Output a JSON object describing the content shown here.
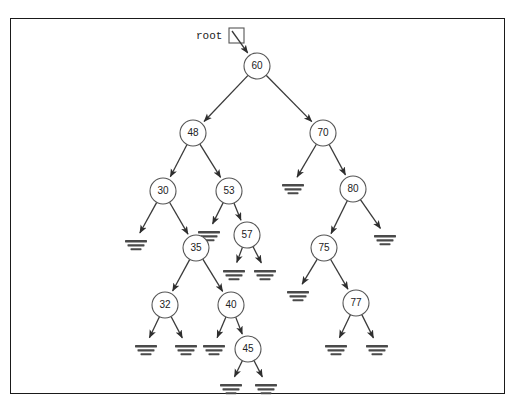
{
  "diagram": {
    "root_pointer_label": "root",
    "null_symbol_name": "ground-null-symbol",
    "colors": {
      "node_stroke": "#555555",
      "node_fill": "#ffffff",
      "edge": "#3a3a3a",
      "null_marker": "#4a4a4a",
      "frame_border": "#1a1a1a",
      "text": "#222222",
      "background": "#ffffff"
    },
    "frame": {
      "x": 10,
      "y": 18,
      "width": 495,
      "height": 376
    },
    "root_pointer": {
      "text_x": 196,
      "text_y": 36,
      "box_x": 229,
      "box_y": 28,
      "box_size": 15,
      "arrow_from_x": 232,
      "arrow_from_y": 31,
      "arrow_to_x": 254,
      "arrow_to_y": 50
    }
  },
  "chart_data": {
    "type": "diagram",
    "node_radius": 13,
    "nodes": [
      {
        "id": "n60",
        "label": "60",
        "x": 257,
        "y": 66
      },
      {
        "id": "n48",
        "label": "48",
        "x": 193,
        "y": 133
      },
      {
        "id": "n70",
        "label": "70",
        "x": 323,
        "y": 133
      },
      {
        "id": "n30",
        "label": "30",
        "x": 163,
        "y": 191
      },
      {
        "id": "n53",
        "label": "53",
        "x": 229,
        "y": 191
      },
      {
        "id": "n80",
        "label": "80",
        "x": 353,
        "y": 189
      },
      {
        "id": "n35",
        "label": "35",
        "x": 196,
        "y": 248
      },
      {
        "id": "n57",
        "label": "57",
        "x": 247,
        "y": 235
      },
      {
        "id": "n75",
        "label": "75",
        "x": 324,
        "y": 248
      },
      {
        "id": "n32",
        "label": "32",
        "x": 165,
        "y": 305
      },
      {
        "id": "n40",
        "label": "40",
        "x": 231,
        "y": 305
      },
      {
        "id": "n77",
        "label": "77",
        "x": 356,
        "y": 303
      },
      {
        "id": "n45",
        "label": "45",
        "x": 248,
        "y": 349
      }
    ],
    "nulls": [
      {
        "id": "x70L",
        "x": 293,
        "y": 184
      },
      {
        "id": "x30L",
        "x": 136,
        "y": 240
      },
      {
        "id": "x53L",
        "x": 209,
        "y": 231
      },
      {
        "id": "x57L",
        "x": 234,
        "y": 270
      },
      {
        "id": "x57R",
        "x": 265,
        "y": 270
      },
      {
        "id": "x80R",
        "x": 385,
        "y": 235
      },
      {
        "id": "x75L",
        "x": 298,
        "y": 291
      },
      {
        "id": "x32L",
        "x": 146,
        "y": 345
      },
      {
        "id": "x32R",
        "x": 186,
        "y": 345
      },
      {
        "id": "x40L",
        "x": 214,
        "y": 345
      },
      {
        "id": "x77L",
        "x": 336,
        "y": 345
      },
      {
        "id": "x77R",
        "x": 377,
        "y": 345
      },
      {
        "id": "x45L",
        "x": 231,
        "y": 384
      },
      {
        "id": "x45R",
        "x": 266,
        "y": 384
      }
    ],
    "edges": [
      {
        "from": "n60",
        "to": "n48",
        "side": "left"
      },
      {
        "from": "n60",
        "to": "n70",
        "side": "right"
      },
      {
        "from": "n48",
        "to": "n30",
        "side": "left"
      },
      {
        "from": "n48",
        "to": "n53",
        "side": "right"
      },
      {
        "from": "n70",
        "to": "x70L",
        "side": "left"
      },
      {
        "from": "n70",
        "to": "n80",
        "side": "right"
      },
      {
        "from": "n30",
        "to": "x30L",
        "side": "left"
      },
      {
        "from": "n30",
        "to": "n35",
        "side": "right"
      },
      {
        "from": "n53",
        "to": "x53L",
        "side": "left"
      },
      {
        "from": "n53",
        "to": "n57",
        "side": "right"
      },
      {
        "from": "n57",
        "to": "x57L",
        "side": "left"
      },
      {
        "from": "n57",
        "to": "x57R",
        "side": "right"
      },
      {
        "from": "n80",
        "to": "n75",
        "side": "left"
      },
      {
        "from": "n80",
        "to": "x80R",
        "side": "right"
      },
      {
        "from": "n35",
        "to": "n32",
        "side": "left"
      },
      {
        "from": "n35",
        "to": "n40",
        "side": "right"
      },
      {
        "from": "n32",
        "to": "x32L",
        "side": "left"
      },
      {
        "from": "n32",
        "to": "x32R",
        "side": "right"
      },
      {
        "from": "n40",
        "to": "x40L",
        "side": "left"
      },
      {
        "from": "n40",
        "to": "n45",
        "side": "right"
      },
      {
        "from": "n45",
        "to": "x45L",
        "side": "left"
      },
      {
        "from": "n45",
        "to": "x45R",
        "side": "right"
      },
      {
        "from": "n75",
        "to": "x75L",
        "side": "left"
      },
      {
        "from": "n75",
        "to": "n77",
        "side": "right"
      },
      {
        "from": "n77",
        "to": "x77L",
        "side": "left"
      },
      {
        "from": "n77",
        "to": "x77R",
        "side": "right"
      }
    ],
    "tree_structure": {
      "value": "60",
      "left": {
        "value": "48",
        "left": {
          "value": "30",
          "left": null,
          "right": {
            "value": "35",
            "left": {
              "value": "32",
              "left": null,
              "right": null
            },
            "right": {
              "value": "40",
              "left": null,
              "right": {
                "value": "45",
                "left": null,
                "right": null
              }
            }
          }
        },
        "right": {
          "value": "53",
          "left": null,
          "right": {
            "value": "57",
            "left": null,
            "right": null
          }
        }
      },
      "right": {
        "value": "70",
        "left": null,
        "right": {
          "value": "80",
          "left": {
            "value": "75",
            "left": null,
            "right": {
              "value": "77",
              "left": null,
              "right": null
            }
          },
          "right": null
        }
      }
    }
  }
}
